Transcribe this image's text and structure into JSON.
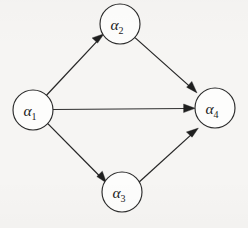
{
  "figure": {
    "kind": "directed-graph",
    "background_color": "#f6f5f3",
    "stroke_color": "#262626",
    "node_fill_color": "#fdfdfc",
    "width": 248,
    "height": 228
  },
  "nodes": [
    {
      "id": "a1",
      "label_base": "α",
      "label_sub": "1",
      "cx": 33,
      "cy": 110,
      "r": 20
    },
    {
      "id": "a2",
      "label_base": "α",
      "label_sub": "2",
      "cx": 120,
      "cy": 24,
      "r": 20
    },
    {
      "id": "a3",
      "label_base": "α",
      "label_sub": "3",
      "cx": 122,
      "cy": 192,
      "r": 20
    },
    {
      "id": "a4",
      "label_base": "α",
      "label_sub": "4",
      "cx": 215,
      "cy": 108,
      "r": 20
    }
  ],
  "edges": [
    {
      "id": "e1",
      "from": "a1",
      "to": "a2",
      "directed": true
    },
    {
      "id": "e2",
      "from": "a1",
      "to": "a4",
      "directed": true
    },
    {
      "id": "e3",
      "from": "a1",
      "to": "a3",
      "directed": true
    },
    {
      "id": "e4",
      "from": "a2",
      "to": "a4",
      "directed": true
    },
    {
      "id": "e5",
      "from": "a3",
      "to": "a4",
      "directed": true
    }
  ]
}
